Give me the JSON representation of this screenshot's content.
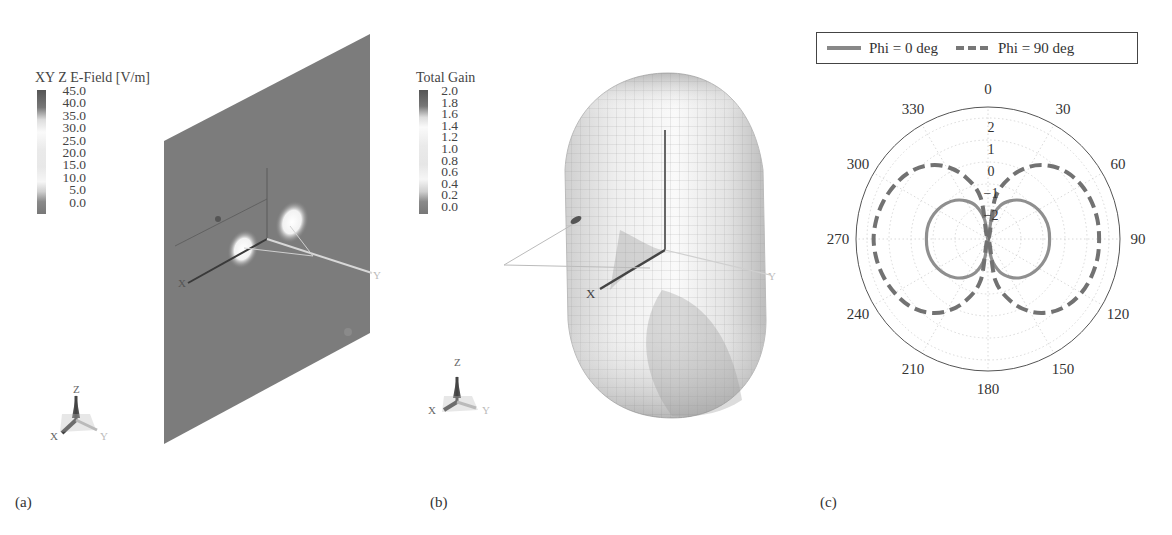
{
  "figure": {
    "panels": [
      {
        "id": "a",
        "label": "(a)",
        "colorbar_title": "XY Z E-Field [V/m]",
        "colorbar_ticks": [
          "45.0",
          "40.0",
          "35.0",
          "30.0",
          "25.0",
          "20.0",
          "15.0",
          "10.0",
          "5.0",
          "0.0"
        ],
        "axis_labels": {
          "x": "X",
          "y": "Y",
          "z": "Z"
        }
      },
      {
        "id": "b",
        "label": "(b)",
        "colorbar_title": "Total Gain",
        "colorbar_ticks": [
          "2.0",
          "1.8",
          "1.6",
          "1.4",
          "1.2",
          "1.0",
          "0.8",
          "0.6",
          "0.4",
          "0.2",
          "0.0"
        ],
        "axis_labels": {
          "x": "X",
          "y": "Y",
          "z": "Z"
        }
      },
      {
        "id": "c",
        "label": "(c)"
      }
    ]
  },
  "chart_data": {
    "type": "polar",
    "title": "",
    "legend": {
      "position": "top",
      "entries": [
        {
          "name": "Phi = 0 deg",
          "style": "solid",
          "color": "#8a8a8a"
        },
        {
          "name": "Phi = 90 deg",
          "style": "dashed",
          "color": "#707070"
        }
      ]
    },
    "angular_axis": {
      "direction": "clockwise",
      "zero_location": "top",
      "tick_labels": [
        "0",
        "30",
        "60",
        "90",
        "120",
        "150",
        "180",
        "210",
        "240",
        "270",
        "300",
        "330"
      ]
    },
    "radial_axis": {
      "tick_labels": [
        "2",
        "1",
        "0",
        "-1",
        "-2"
      ],
      "range": [
        -3.5,
        2.5
      ],
      "grid": true
    },
    "theta_deg": [
      0,
      10,
      20,
      30,
      40,
      50,
      60,
      70,
      80,
      90,
      100,
      110,
      120,
      130,
      140,
      150,
      160,
      170,
      180,
      190,
      200,
      210,
      220,
      230,
      240,
      250,
      260,
      270,
      280,
      290,
      300,
      310,
      320,
      330,
      340,
      350
    ],
    "series": [
      {
        "name": "Phi = 0 deg",
        "values": [
          -3.5,
          -2.6,
          -1.9,
          -1.5,
          -1.2,
          -1.0,
          -0.85,
          -0.75,
          -0.7,
          -0.7,
          -0.7,
          -0.75,
          -0.85,
          -1.0,
          -1.2,
          -1.5,
          -1.9,
          -2.6,
          -3.5,
          -2.6,
          -1.9,
          -1.5,
          -1.2,
          -1.0,
          -0.85,
          -0.75,
          -0.7,
          -0.7,
          -0.7,
          -0.75,
          -0.85,
          -1.0,
          -1.2,
          -1.5,
          -1.9,
          -2.6
        ]
      },
      {
        "name": "Phi = 90 deg",
        "values": [
          -3.5,
          -1.6,
          -0.5,
          0.3,
          0.85,
          1.2,
          1.4,
          1.5,
          1.55,
          1.55,
          1.55,
          1.5,
          1.4,
          1.2,
          0.85,
          0.3,
          -0.5,
          -1.6,
          -3.5,
          -1.6,
          -0.5,
          0.3,
          0.85,
          1.2,
          1.4,
          1.55,
          1.65,
          1.7,
          1.65,
          1.55,
          1.4,
          1.2,
          0.85,
          0.3,
          -0.5,
          -1.6
        ]
      }
    ]
  }
}
